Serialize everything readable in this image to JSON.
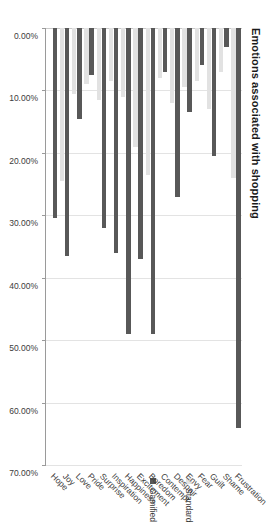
{
  "chart_data": {
    "type": "bar",
    "orientation": "horizontal",
    "title": "Emotions associated with shopping",
    "xlabel": "",
    "ylabel": "",
    "xlim": [
      0,
      70
    ],
    "xticks": [
      "0.00%",
      "10.00%",
      "20.00%",
      "30.00%",
      "40.00%",
      "50.00%",
      "60.00%",
      "70.00%"
    ],
    "xtick_values": [
      0,
      10,
      20,
      30,
      40,
      50,
      60,
      70
    ],
    "grid": true,
    "legend_position": "right",
    "categories": [
      "Hope",
      "Joy",
      "Love",
      "Pride",
      "Surprise",
      "Inspiration",
      "Happiness",
      "Excitement",
      "Boredom",
      "Contempt",
      "Despair",
      "Envy",
      "Fear",
      "Guilt",
      "Shame",
      "Frustration"
    ],
    "series": [
      {
        "name": "Gamified",
        "color": "#585858",
        "values": [
          30.5,
          36.5,
          14.5,
          7.5,
          32.0,
          36.0,
          49.0,
          37.0,
          49.0,
          7.0,
          27.0,
          13.5,
          6.0,
          20.5,
          3.0,
          64.0
        ]
      },
      {
        "name": "Standard",
        "color": "#e2e2e2",
        "values": [
          0.0,
          24.5,
          10.5,
          9.0,
          11.5,
          8.5,
          11.0,
          19.0,
          23.5,
          8.0,
          12.0,
          9.5,
          8.5,
          13.0,
          7.0,
          24.0
        ]
      }
    ]
  },
  "legend": {
    "items": [
      {
        "label": "Gamified",
        "color": "#585858"
      },
      {
        "label": "Standard",
        "color": "#e2e2e2"
      }
    ]
  }
}
